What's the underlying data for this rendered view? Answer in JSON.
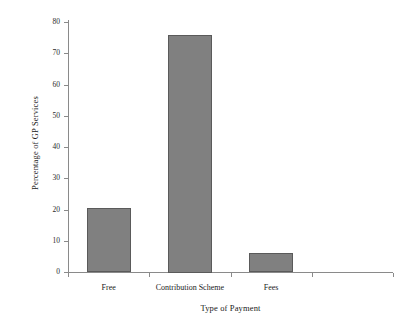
{
  "chart_data": {
    "type": "bar",
    "title": "",
    "subtitle": "",
    "xlabel": "Type of Payment",
    "ylabel": "Percentage of GP Services",
    "categories": [
      "Free",
      "Contribution Scheme",
      "Fees"
    ],
    "values": [
      20.5,
      76,
      6
    ],
    "series": [
      {
        "name": "Percentage of GP Services",
        "values": [
          20.5,
          76,
          6
        ]
      }
    ],
    "ylim": [
      0,
      80
    ],
    "yticks": [
      0,
      10,
      20,
      30,
      40,
      50,
      60,
      70,
      80
    ],
    "ytick_labels": [
      "0",
      "10",
      "20",
      "30",
      "40",
      "50",
      "60",
      "70",
      "80"
    ],
    "xtick_labels": [
      "Free",
      "Contribution Scheme",
      "Fees"
    ],
    "grid": false,
    "legend": false,
    "legend_position": "none",
    "bar_color": "#808080",
    "bar_edge_color": "#5a5a5a",
    "axis_color": "#8a8a8a",
    "background_color": "#ffffff"
  }
}
